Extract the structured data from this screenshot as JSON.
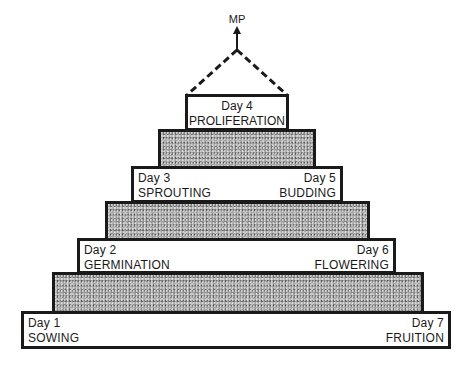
{
  "diagram": {
    "type": "stepped-pyramid",
    "apex_label": "MP",
    "top": {
      "day": "Day 4",
      "stage": "PROLIFERATION"
    },
    "tiers": [
      {
        "left": {
          "day": "Day 3",
          "stage": "SPROUTING"
        },
        "right": {
          "day": "Day 5",
          "stage": "BUDDING"
        }
      },
      {
        "left": {
          "day": "Day 2",
          "stage": "GERMINATION"
        },
        "right": {
          "day": "Day 6",
          "stage": "FLOWERING"
        }
      },
      {
        "left": {
          "day": "Day 1",
          "stage": "SOWING"
        },
        "right": {
          "day": "Day 7",
          "stage": "FRUITION"
        }
      }
    ],
    "colors": {
      "outline": "#1a1a1a",
      "stone_fill": "#a9a9a9",
      "label_fill": "#ffffff"
    }
  }
}
